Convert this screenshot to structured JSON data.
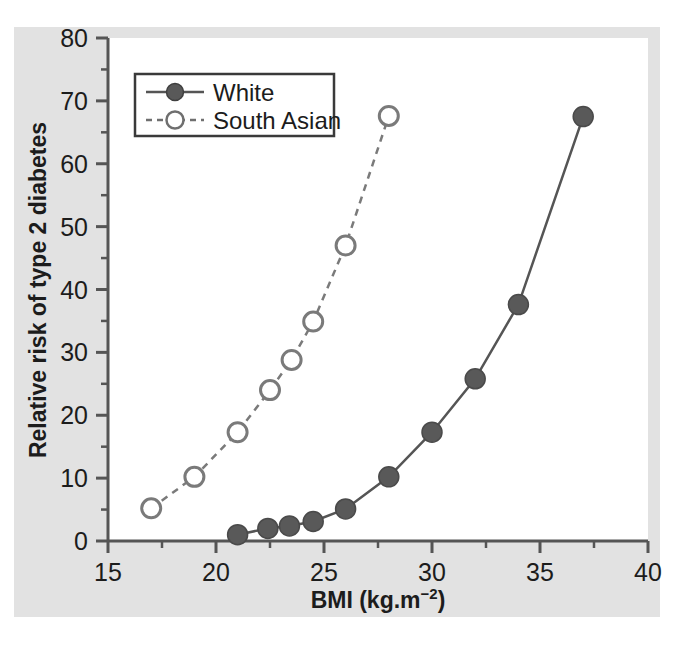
{
  "figure": {
    "panel_bg": "#e2e2e2",
    "plot_bg": "#ffffff",
    "axis_color": "#555555",
    "text_color": "#1c1c1c"
  },
  "chart_data": {
    "type": "line",
    "title": "",
    "subtitle": "",
    "xlabel": "BMI (kg.m",
    "xlabel_sup": "−2",
    "xlabel_tail": ")",
    "xlabel_full": "BMI (kg.m−2)",
    "ylabel": "Relative risk of type 2 diabetes",
    "xlim": [
      15,
      40
    ],
    "ylim": [
      0,
      80
    ],
    "xticks": [
      15,
      20,
      25,
      30,
      35,
      40
    ],
    "xtick_labels": [
      "15",
      "20",
      "25",
      "30",
      "35",
      "40"
    ],
    "yticks": [
      0,
      10,
      20,
      30,
      40,
      50,
      60,
      70,
      80
    ],
    "ytick_labels": [
      "0",
      "10",
      "20",
      "30",
      "40",
      "50",
      "60",
      "70",
      "80"
    ],
    "x_minor_ticks": [
      17.5,
      22.5,
      27.5,
      32.5,
      37.5
    ],
    "y_minor_ticks": [
      5,
      15,
      25,
      35,
      45,
      55,
      65,
      75
    ],
    "grid": false,
    "legend_position": "upper-left",
    "series": [
      {
        "name": "White",
        "marker": "filled-circle",
        "line_style": "solid",
        "color": "#555555",
        "marker_fill": "#595959",
        "points": [
          {
            "x": 21.0,
            "y": 1.0
          },
          {
            "x": 22.4,
            "y": 2.0
          },
          {
            "x": 23.4,
            "y": 2.4
          },
          {
            "x": 24.5,
            "y": 3.1
          },
          {
            "x": 26.0,
            "y": 5.1
          },
          {
            "x": 28.0,
            "y": 10.2
          },
          {
            "x": 30.0,
            "y": 17.3
          },
          {
            "x": 32.0,
            "y": 25.8
          },
          {
            "x": 34.0,
            "y": 37.6
          },
          {
            "x": 37.0,
            "y": 67.5
          }
        ]
      },
      {
        "name": "South Asian",
        "marker": "open-circle",
        "line_style": "dashed",
        "color": "#7a7a7a",
        "marker_fill": "#ffffff",
        "points": [
          {
            "x": 17.0,
            "y": 5.2
          },
          {
            "x": 19.0,
            "y": 10.2
          },
          {
            "x": 21.0,
            "y": 17.3
          },
          {
            "x": 22.5,
            "y": 24.0
          },
          {
            "x": 23.5,
            "y": 28.8
          },
          {
            "x": 24.5,
            "y": 34.9
          },
          {
            "x": 26.0,
            "y": 47.0
          },
          {
            "x": 28.0,
            "y": 67.6
          }
        ]
      }
    ],
    "legend": [
      {
        "label": "White",
        "marker": "filled-circle",
        "line_style": "solid"
      },
      {
        "label": "South Asian",
        "marker": "open-circle",
        "line_style": "dashed"
      }
    ]
  }
}
